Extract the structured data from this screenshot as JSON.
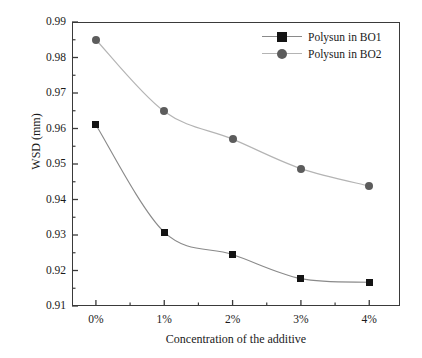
{
  "chart_data": {
    "type": "line",
    "title": "",
    "xlabel": "Concentration of the additive",
    "ylabel": "WSD (mm)",
    "categories": [
      "0%",
      "1%",
      "2%",
      "3%",
      "4%"
    ],
    "x": [
      0,
      1,
      2,
      3,
      4
    ],
    "ylim": [
      0.91,
      0.99
    ],
    "xlim": [
      -0.35,
      4.45
    ],
    "yticks": [
      "0.91",
      "0.92",
      "0.93",
      "0.94",
      "0.95",
      "0.96",
      "0.97",
      "0.98",
      "0.99"
    ],
    "ytick_values": [
      0.91,
      0.92,
      0.93,
      0.94,
      0.95,
      0.96,
      0.97,
      0.98,
      0.99
    ],
    "minor_ticks": true,
    "grid": false,
    "legend_position": "top-right",
    "series": [
      {
        "name": "Polysun in BO1",
        "marker": "square",
        "color": "#141414",
        "line_color": "#8a8a8a",
        "values": [
          0.961,
          0.9308,
          0.9245,
          0.9177,
          0.9167
        ]
      },
      {
        "name": "Polysun in BO2",
        "marker": "circle",
        "color": "#5c5c5c",
        "line_color": "#b4b4b4",
        "values": [
          0.985,
          0.9648,
          0.957,
          0.9487,
          0.9438
        ]
      }
    ]
  },
  "axes": {
    "frame_color": "#3a3a3a"
  }
}
